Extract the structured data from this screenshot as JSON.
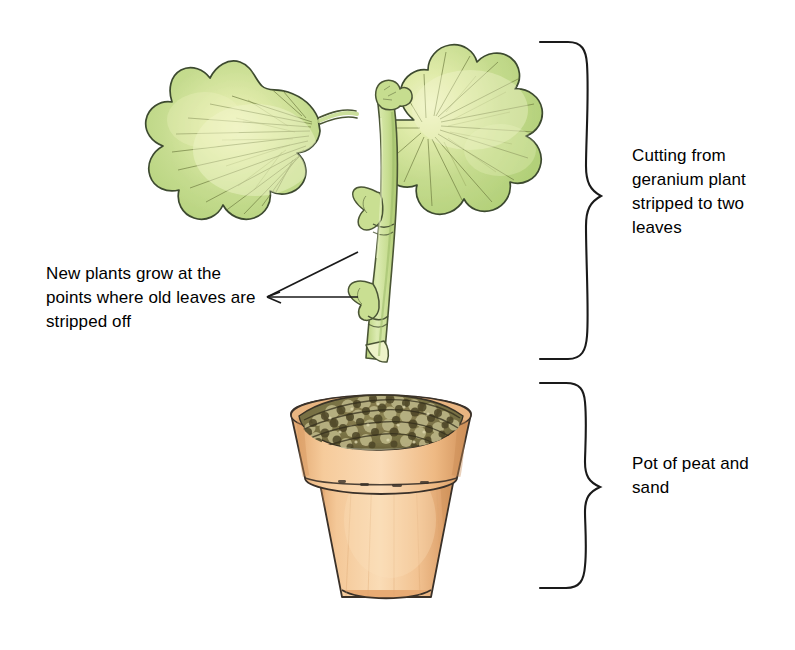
{
  "figure": {
    "background_color": "#ffffff",
    "ink_color": "#1a1a1a"
  },
  "labels": {
    "cutting": {
      "text": "Cutting from geranium plant stripped to two leaves",
      "position": "right-top"
    },
    "pot": {
      "text": "Pot of peat and sand",
      "position": "right-bottom"
    },
    "new_plants": {
      "text": "New plants grow at the points where old leaves are stripped off",
      "position": "left-middle"
    }
  },
  "illustration": {
    "leaves": [
      {
        "name": "left-leaf",
        "fill": "#c3da8d",
        "highlight": "#e8f0bb",
        "outline": "#3f4a32"
      },
      {
        "name": "right-leaf",
        "fill": "#c3da8d",
        "highlight": "#e8f0bb",
        "outline": "#3f4a32"
      }
    ],
    "stem": {
      "name": "cutting-stem",
      "fill": "#cbe093",
      "outline": "#4a5535",
      "node_count": 2,
      "cut_end": "angled"
    },
    "pot": {
      "name": "terracotta-pot",
      "fill": "#f3c391",
      "rim_fill": "#efbf8b",
      "shade": "#d79c61",
      "outline": "#3a3129"
    },
    "compost": {
      "name": "peat-and-sand-surface",
      "fill": "#8b8255",
      "granule_dark": "#4a4428",
      "granule_light": "#c9c08c"
    },
    "braces": [
      {
        "name": "brace-cutting",
        "top": 42,
        "bottom": 360,
        "tip_y": 196
      },
      {
        "name": "brace-pot",
        "top": 383,
        "bottom": 589,
        "tip_y": 487
      }
    ],
    "leader_lines": {
      "name": "new-plants-leaders",
      "origin_x": 267,
      "origin_y": 297,
      "targets": [
        [
          358,
          252
        ],
        [
          358,
          297
        ]
      ]
    }
  }
}
